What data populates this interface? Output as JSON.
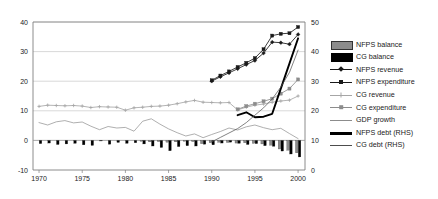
{
  "chart_data": {
    "type": "line",
    "title": "",
    "xlabel": "",
    "ylabel": "",
    "xlim": [
      1969.3,
      2000.8
    ],
    "ylim": [
      -10,
      40
    ],
    "y2lim": [
      0,
      50
    ],
    "grid": true,
    "legend_position": "right",
    "x_ticks": [
      1970,
      1975,
      1980,
      1985,
      1990,
      1995,
      2000
    ],
    "y_ticks": [
      -10,
      0,
      10,
      20,
      30,
      40
    ],
    "y2_ticks": [
      0,
      10,
      20,
      30,
      40,
      50
    ],
    "years": [
      1970,
      1971,
      1972,
      1973,
      1974,
      1975,
      1976,
      1977,
      1978,
      1979,
      1980,
      1981,
      1982,
      1983,
      1984,
      1985,
      1986,
      1987,
      1988,
      1989,
      1990,
      1991,
      1992,
      1993,
      1994,
      1995,
      1996,
      1997,
      1998,
      1999,
      2000
    ],
    "series": [
      {
        "name": "NFPS balance",
        "type": "bar",
        "axis": "left",
        "color": "#8c8c8c",
        "x": [
          1982,
          1983,
          1984,
          1985,
          1986,
          1987,
          1988,
          1989,
          1990,
          1991,
          1992,
          1993,
          1994,
          1995,
          1996,
          1997,
          1998,
          1999,
          2000
        ],
        "values": [
          -0.3,
          -0.5,
          -0.4,
          -0.6,
          -0.5,
          -0.3,
          -0.4,
          -1.1,
          -0.8,
          -0.6,
          -0.7,
          -0.9,
          -0.8,
          -1.0,
          -1.2,
          -1.6,
          -2.9,
          -3.3,
          -4.2
        ]
      },
      {
        "name": "CG balance",
        "type": "bar",
        "axis": "left",
        "color": "#000000",
        "x": [
          1970,
          1971,
          1972,
          1973,
          1974,
          1975,
          1976,
          1977,
          1978,
          1979,
          1980,
          1981,
          1982,
          1983,
          1984,
          1985,
          1986,
          1987,
          1988,
          1989,
          1990,
          1991,
          1992,
          1993,
          1994,
          1995,
          1996,
          1997,
          1998,
          1999,
          2000
        ],
        "values": [
          -1.1,
          -0.9,
          -1.4,
          -1.2,
          -1.0,
          -1.5,
          -1.7,
          -0.2,
          -1.3,
          -0.7,
          -1.0,
          -0.8,
          -1.2,
          -1.9,
          -2.4,
          -3.5,
          -2.1,
          -1.8,
          -1.9,
          -1.3,
          -1.5,
          -0.9,
          -0.6,
          -1.0,
          -1.4,
          -1.1,
          -1.8,
          -2.0,
          -3.6,
          -4.6,
          -5.6
        ]
      },
      {
        "name": "NFPS revenue",
        "type": "line",
        "axis": "left",
        "color": "#1a1a1a",
        "marker": "diamond",
        "x": [
          1990,
          1991,
          1992,
          1993,
          1994,
          1995,
          1996,
          1997,
          1998,
          1999,
          2000
        ],
        "values": [
          20.0,
          21.5,
          22.8,
          24.2,
          25.6,
          27.0,
          29.5,
          33.2,
          33.0,
          32.5,
          35.8
        ]
      },
      {
        "name": "NFPS expenditure",
        "type": "line",
        "axis": "left",
        "color": "#1a1a1a",
        "marker": "square",
        "x": [
          1990,
          1991,
          1992,
          1993,
          1994,
          1995,
          1996,
          1997,
          1998,
          1999,
          2000
        ],
        "values": [
          20.3,
          21.9,
          23.3,
          24.8,
          26.2,
          27.8,
          30.8,
          35.4,
          36.0,
          36.2,
          38.3
        ]
      },
      {
        "name": "CG revenue",
        "type": "line",
        "axis": "left",
        "color": "#a6a6a6",
        "marker": "cross",
        "x": [
          1970,
          1971,
          1972,
          1973,
          1974,
          1975,
          1976,
          1977,
          1978,
          1979,
          1980,
          1981,
          1982,
          1983,
          1984,
          1985,
          1986,
          1987,
          1988,
          1989,
          1990,
          1991,
          1992,
          1993,
          1994,
          1995,
          1996,
          1997,
          1998,
          1999,
          2000
        ],
        "values": [
          11.5,
          11.9,
          11.8,
          11.7,
          11.8,
          11.6,
          11.1,
          11.4,
          11.3,
          11.2,
          10.2,
          11.0,
          11.2,
          11.5,
          11.6,
          11.9,
          12.4,
          13.0,
          13.5,
          12.9,
          12.8,
          12.7,
          12.8,
          10.3,
          11.2,
          11.9,
          12.3,
          12.9,
          13.3,
          13.6,
          15.0
        ]
      },
      {
        "name": "CG expenditure",
        "type": "line",
        "axis": "left",
        "color": "#8c8c8c",
        "marker": "square",
        "x": [
          1993,
          1994,
          1995,
          1996,
          1997,
          1998,
          1999,
          2000
        ],
        "values": [
          10.5,
          11.6,
          12.4,
          13.2,
          14.1,
          15.8,
          17.5,
          20.6
        ]
      },
      {
        "name": "GDP growth",
        "type": "line",
        "axis": "left",
        "color": "#8c8c8c",
        "marker": "none",
        "x": [
          1970,
          1971,
          1972,
          1973,
          1974,
          1975,
          1976,
          1977,
          1978,
          1979,
          1980,
          1981,
          1982,
          1983,
          1984,
          1985,
          1986,
          1987,
          1988,
          1989,
          1990,
          1991,
          1992,
          1993,
          1994,
          1995,
          1996,
          1997,
          1998,
          1999,
          2000
        ],
        "values": [
          6.0,
          5.2,
          6.3,
          6.7,
          5.9,
          6.2,
          4.8,
          3.6,
          4.7,
          4.2,
          4.4,
          3.1,
          6.5,
          7.3,
          5.5,
          3.9,
          2.6,
          1.5,
          2.2,
          0.9,
          2.0,
          3.0,
          4.2,
          3.5,
          4.6,
          5.2,
          4.3,
          3.6,
          4.1,
          2.3,
          0.6
        ]
      },
      {
        "name": "NFPS debt (RHS)",
        "type": "line",
        "axis": "right",
        "color": "#000000",
        "marker": "none",
        "x": [
          1993,
          1994,
          1995,
          1996,
          1997,
          1998,
          1999,
          2000
        ],
        "values": [
          18.5,
          19.5,
          17.8,
          18.0,
          19.0,
          27.5,
          36.0,
          44.5
        ]
      },
      {
        "name": "CG debt (RHS)",
        "type": "line",
        "axis": "right",
        "color": "#4d4d4d",
        "marker": "none",
        "x": [
          1990,
          1991,
          1992,
          1993,
          1994,
          1995,
          1996,
          1997,
          1998,
          1999,
          2000
        ],
        "values": [
          9.5,
          11.0,
          12.5,
          14.0,
          16.0,
          18.5,
          21.0,
          24.0,
          28.0,
          33.0,
          40.5
        ]
      }
    ]
  },
  "legend": {
    "items": [
      {
        "label": "NFPS balance",
        "key": "bar-gray"
      },
      {
        "label": "CG balance",
        "key": "bar-black"
      },
      {
        "label": "NFPS revenue",
        "key": "line-diamond"
      },
      {
        "label": "NFPS expenditure",
        "key": "line-square"
      },
      {
        "label": "CG revenue",
        "key": "line-cross-gray"
      },
      {
        "label": "CG expenditure",
        "key": "line-square-gray"
      },
      {
        "label": "GDP growth",
        "key": "line-plain-gray"
      },
      {
        "label": "NFPS debt (RHS)",
        "key": "line-thick-black"
      },
      {
        "label": "CG debt (RHS)",
        "key": "line-plain-dark"
      }
    ]
  },
  "colors": {
    "grid": "#c8c8c8",
    "axis": "#808080",
    "text": "#1a1a1a",
    "nfps_balance": "#8c8c8c",
    "cg_balance": "#000000",
    "cg_revenue": "#a6a6a6",
    "cg_expenditure": "#8c8c8c",
    "gdp_growth": "#8c8c8c",
    "nfps_debt": "#000000",
    "cg_debt": "#4d4d4d"
  }
}
